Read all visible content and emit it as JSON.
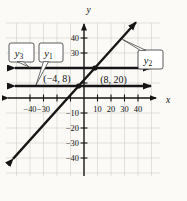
{
  "figure": {
    "background": "#fbfaf7",
    "line_color": "#151515",
    "grid_color": "#d6d4cf",
    "box_fill": "#ffffff",
    "box_border_color": "#4a4a4a",
    "text_color": "#111111"
  },
  "chart_data": {
    "type": "line",
    "title": "",
    "xlabel": "x",
    "ylabel": "y",
    "xlim": [
      -47,
      51
    ],
    "ylim": [
      -51,
      51
    ],
    "grid": true,
    "tick_step": 10,
    "x_ticks": [
      {
        "value": -40,
        "label": "−40"
      },
      {
        "value": -30,
        "label": "−30"
      },
      {
        "value": -20,
        "label": ""
      },
      {
        "value": -10,
        "label": ""
      },
      {
        "value": 10,
        "label": "10"
      },
      {
        "value": 20,
        "label": "20"
      },
      {
        "value": 30,
        "label": "30"
      },
      {
        "value": 40,
        "label": "40"
      }
    ],
    "y_ticks": [
      {
        "value": 40,
        "label": "40"
      },
      {
        "value": 30,
        "label": "30"
      },
      {
        "value": 20,
        "label": ""
      },
      {
        "value": 10,
        "label": ""
      },
      {
        "value": -10,
        "label": "−10"
      },
      {
        "value": -20,
        "label": "−20"
      },
      {
        "value": -30,
        "label": "−30"
      },
      {
        "value": -40,
        "label": "−40"
      }
    ],
    "series": [
      {
        "id": "y1",
        "label_base": "y",
        "label_sub": "1",
        "type": "horizontal",
        "y": 8,
        "arrows": "both"
      },
      {
        "id": "y2",
        "label_base": "y",
        "label_sub": "2",
        "type": "linear",
        "slope": 1,
        "y_intercept": 12,
        "points_through": [
          [
            -4,
            8
          ],
          [
            8,
            20
          ]
        ],
        "arrows": "both"
      },
      {
        "id": "y3",
        "label_base": "y",
        "label_sub": "3",
        "type": "horizontal",
        "y": 20,
        "arrows": "both"
      }
    ],
    "marked_points": [
      {
        "x": -4,
        "y": 8,
        "label": "(−4, 8)"
      },
      {
        "x": 8,
        "y": 20,
        "label": "(8, 20)"
      }
    ]
  }
}
